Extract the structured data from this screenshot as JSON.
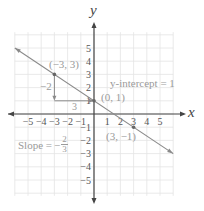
{
  "chart_data": {
    "type": "line",
    "title": "",
    "xlabel": "x",
    "ylabel": "y",
    "xlim": [
      -6,
      6
    ],
    "ylim": [
      -6,
      6
    ],
    "grid": true,
    "x_ticks": [
      "-5",
      "-4",
      "-3",
      "-2",
      "-1",
      "1",
      "2",
      "3",
      "4",
      "5"
    ],
    "y_ticks": [
      "5",
      "4",
      "3",
      "2",
      "1",
      "-1",
      "-2",
      "-3",
      "-4",
      "-5"
    ],
    "series": [
      {
        "name": "line",
        "equation": "y = -2/3 x + 1",
        "slope": -0.6667,
        "intercept": 1,
        "x": [
          -6,
          6
        ],
        "y": [
          5,
          -3
        ]
      }
    ],
    "points": [
      {
        "label": "(−3, 3)",
        "x": -3,
        "y": 3
      },
      {
        "label": "(0, 1)",
        "x": 0,
        "y": 1
      },
      {
        "label": "(3, −1)",
        "x": 3,
        "y": -1
      }
    ],
    "annotations": {
      "rise": "−2",
      "run": "3",
      "intercept_label": "y-intercept = 1",
      "slope_label": "Slope = ",
      "slope_num": "2",
      "slope_den": "3",
      "slope_sign": "−"
    }
  },
  "colors": {
    "axis": "#444444",
    "grid": "#e4e4e4",
    "line": "#8a8a8a",
    "label": "#9a9a9a",
    "tick": "#555555"
  }
}
